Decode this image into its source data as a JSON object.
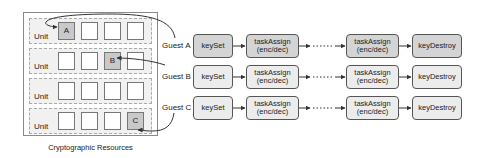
{
  "resources": {
    "caption": "Cryptographic Resources",
    "units": [
      {
        "label": "Unit",
        "slots": [
          "A",
          "",
          "",
          ""
        ],
        "used": [
          true,
          false,
          false,
          false
        ]
      },
      {
        "label": "Unit",
        "slots": [
          "",
          "",
          "B",
          ""
        ],
        "used": [
          false,
          false,
          true,
          false
        ]
      },
      {
        "label": "Unit",
        "slots": [
          "",
          "",
          "",
          ""
        ],
        "used": [
          false,
          false,
          false,
          false
        ]
      },
      {
        "label": "Unit",
        "slots": [
          "",
          "",
          "",
          "C"
        ],
        "used": [
          false,
          false,
          false,
          true
        ]
      }
    ]
  },
  "guests": [
    {
      "name": "Guest A",
      "flow": [
        "keySet",
        "taskAssign\n(enc/dec)",
        "taskAssign\n(enc/dec)",
        "keyDestroy"
      ]
    },
    {
      "name": "Guest B",
      "flow": [
        "keySet",
        "taskAssign\n(enc/dec)",
        "taskAssign\n(enc/dec)",
        "keyDestroy"
      ]
    },
    {
      "name": "Guest C",
      "flow": [
        "keySet",
        "taskAssign\n(enc/dec)",
        "taskAssign\n(enc/dec)",
        "keyDestroy"
      ]
    }
  ],
  "labels": {
    "keyset": "keySet",
    "task_line1": "taskAssign",
    "task_line2": "(enc/dec)",
    "keydestroy": "keyDestroy",
    "ellipsis": "·····"
  },
  "colors": {
    "box_dark": "#d4d4d4",
    "box_light": "#ececec",
    "slot_used": "#c9c9c9",
    "border": "#555555"
  }
}
